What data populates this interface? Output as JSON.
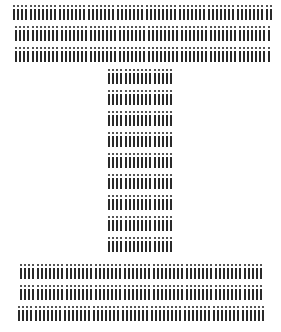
{
  "figure": {
    "glyph_char": "i",
    "ink_color": "#2a2a2a",
    "dot_color": "#555555",
    "background": "#ffffff"
  },
  "rows": [
    {
      "section": "top-bar",
      "x": 13,
      "y": 4,
      "count": 63
    },
    {
      "section": "top-bar",
      "x": 15,
      "y": 25,
      "count": 62
    },
    {
      "section": "top-bar",
      "x": 15,
      "y": 46,
      "count": 62
    },
    {
      "section": "stem",
      "x": 108,
      "y": 68,
      "count": 16
    },
    {
      "section": "stem",
      "x": 108,
      "y": 89,
      "count": 16
    },
    {
      "section": "stem",
      "x": 108,
      "y": 110,
      "count": 16
    },
    {
      "section": "stem",
      "x": 108,
      "y": 131,
      "count": 16
    },
    {
      "section": "stem",
      "x": 108,
      "y": 152,
      "count": 16
    },
    {
      "section": "stem",
      "x": 108,
      "y": 173,
      "count": 16
    },
    {
      "section": "stem",
      "x": 108,
      "y": 194,
      "count": 16
    },
    {
      "section": "stem",
      "x": 108,
      "y": 215,
      "count": 16
    },
    {
      "section": "stem",
      "x": 108,
      "y": 236,
      "count": 16
    },
    {
      "section": "bottom-bar",
      "x": 20,
      "y": 263,
      "count": 59
    },
    {
      "section": "bottom-bar",
      "x": 20,
      "y": 284,
      "count": 59
    },
    {
      "section": "bottom-bar",
      "x": 18,
      "y": 305,
      "count": 60
    }
  ]
}
